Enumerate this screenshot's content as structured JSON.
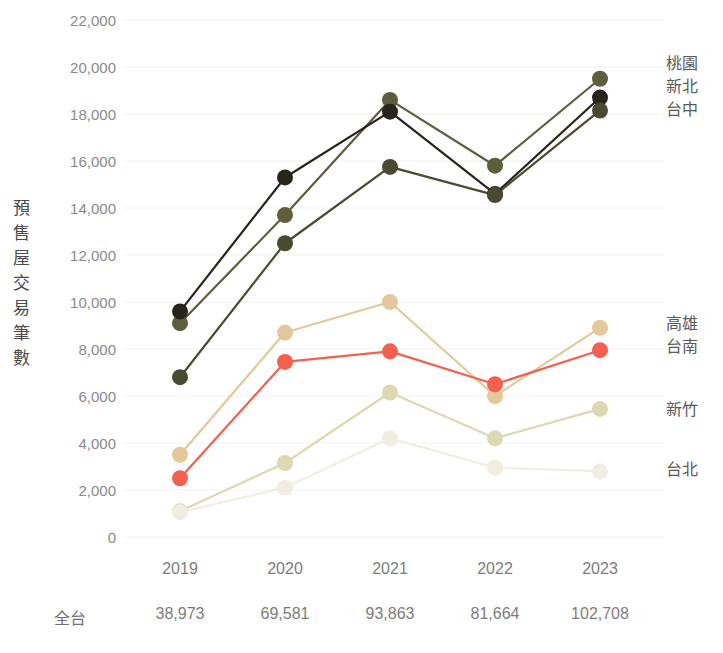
{
  "chart_data": {
    "type": "line",
    "title": "",
    "xlabel": "",
    "ylabel": "預售屋交易筆數",
    "categories": [
      "2019",
      "2020",
      "2021",
      "2022",
      "2023"
    ],
    "ylim": [
      0,
      22000
    ],
    "ytick_step": 2000,
    "yticks": [
      "0",
      "2,000",
      "4,000",
      "6,000",
      "8,000",
      "10,000",
      "12,000",
      "14,000",
      "16,000",
      "18,000",
      "20,000",
      "22,000"
    ],
    "grid": true,
    "legend_position": "right",
    "series": [
      {
        "name": "桃園",
        "color": "#5e5e3c",
        "values": [
          9100,
          13700,
          18600,
          15800,
          19500
        ]
      },
      {
        "name": "新北",
        "color": "#26241c",
        "values": [
          9600,
          15300,
          18100,
          14600,
          18700
        ]
      },
      {
        "name": "台中",
        "color": "#4a4a30",
        "values": [
          6800,
          12500,
          15750,
          14550,
          18150
        ]
      },
      {
        "name": "高雄",
        "color": "#e3c89c",
        "values": [
          3500,
          8700,
          10000,
          6000,
          8900
        ]
      },
      {
        "name": "台南",
        "color": "#f4604f",
        "values": [
          2500,
          7450,
          7900,
          6500,
          7950
        ]
      },
      {
        "name": "新竹",
        "color": "#dcd8b2",
        "values": [
          1100,
          3150,
          6150,
          4200,
          5450
        ]
      },
      {
        "name": "台北",
        "color": "#f1eee1",
        "values": [
          1050,
          2100,
          4200,
          2950,
          2800
        ]
      }
    ],
    "legend_groups": [
      {
        "labels": [
          "桃園",
          "新北",
          "台中"
        ],
        "anchor_value": 19200
      },
      {
        "labels": [
          "高雄",
          "台南"
        ],
        "anchor_value": 8600
      },
      {
        "labels": [
          "新竹"
        ],
        "anchor_value": 5450
      },
      {
        "labels": [
          "台北"
        ],
        "anchor_value": 2900
      }
    ],
    "totals": {
      "label": "全台",
      "values": [
        "38,973",
        "69,581",
        "93,863",
        "81,664",
        "102,708"
      ]
    }
  },
  "style": {
    "grid_color": "#f2f2f0",
    "tick_text_color": "#8a8a8a",
    "axis_title_color": "#4a4a4a",
    "background": "#ffffff"
  }
}
